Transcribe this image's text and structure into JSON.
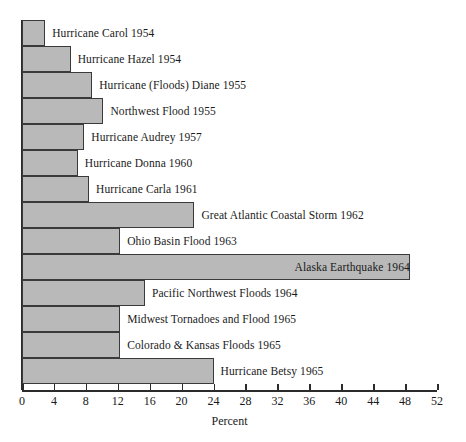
{
  "chart_data": {
    "type": "bar",
    "orientation": "horizontal",
    "title": "",
    "xlabel": "Percent",
    "ylabel": "",
    "xlim": [
      0,
      52
    ],
    "xticks": [
      0,
      4,
      8,
      12,
      16,
      20,
      24,
      28,
      32,
      36,
      40,
      44,
      48,
      52
    ],
    "xtick_labels": [
      "0",
      "4",
      "8",
      "12",
      "16",
      "20",
      "24",
      "28",
      "32",
      "36",
      "40",
      "44",
      "48",
      "52"
    ],
    "grid": false,
    "legend": false,
    "bar_fill_color": "#b9b9b9",
    "bar_edge_color": "#3a3a3a",
    "axis_color": "#2b2b2b",
    "categories": [
      "Hurricane Carol 1954",
      "Hurricane Hazel 1954",
      "Hurricane (Floods) Diane 1955",
      "Northwest Flood 1955",
      "Hurricane Audrey 1957",
      "Hurricane Donna 1960",
      "Hurricane Carla 1961",
      "Great Atlantic Coastal Storm 1962",
      "Ohio Basin Flood 1963",
      "Alaska Earthquake 1964",
      "Pacific Northwest Floods 1964",
      "Midwest Tornadoes and Flood 1965",
      "Colorado & Kansas Floods 1965",
      "Hurricane Betsy 1965"
    ],
    "values": [
      2.9,
      6.1,
      8.8,
      10.2,
      7.8,
      7.0,
      8.4,
      21.6,
      12.3,
      48.6,
      15.4,
      12.3,
      12.3,
      24.0
    ],
    "label_placement": [
      "outside",
      "outside",
      "outside",
      "outside",
      "outside",
      "outside",
      "outside",
      "outside",
      "outside",
      "inside",
      "outside",
      "outside",
      "outside",
      "outside"
    ]
  }
}
